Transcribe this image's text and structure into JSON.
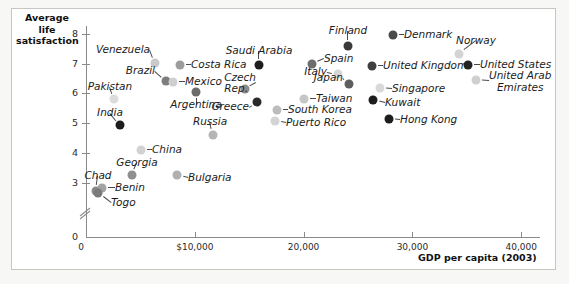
{
  "chart_data": {
    "type": "scatter",
    "title": "",
    "ylabel": "Average life satisfaction",
    "xlabel": "GDP per capita (2003)",
    "xlim": [
      0,
      44000
    ],
    "ylim": [
      2.6,
      8.4
    ],
    "y_ticks": [
      "0",
      "3",
      "4",
      "5",
      "6",
      "7",
      "8"
    ],
    "x_ticks": [
      "0",
      "$10,000",
      "20,000",
      "30,000",
      "40,000"
    ],
    "x_tick_values": [
      0,
      10000,
      20000,
      30000,
      40000
    ],
    "y_axis_break": true,
    "grid": false,
    "legend": "none",
    "points": [
      {
        "name": "Venezuela",
        "x": 6400,
        "y": 7.05,
        "shade": "#c9c9c9",
        "label_pos": "r",
        "lx": 150,
        "ly": 50,
        "dx": 155,
        "dy": 63
      },
      {
        "name": "Brazil",
        "x": 7450,
        "y": 6.65,
        "shade": "#7d7d7d",
        "label_pos": "r",
        "lx": 155,
        "ly": 71,
        "dx": 166,
        "dy": 81
      },
      {
        "name": "Costa Rica",
        "x": 9300,
        "y": 7.0,
        "shade": "#9c9c9c",
        "label_pos": "l",
        "lx": 191,
        "ly": 65,
        "dx": 180,
        "dy": 65
      },
      {
        "name": "Mexico",
        "x": 8050,
        "y": 6.6,
        "shade": "#cfcfcf",
        "label_pos": "l",
        "lx": 185,
        "ly": 82,
        "dx": 173,
        "dy": 82
      },
      {
        "name": "Argentina",
        "x": 10200,
        "y": 6.3,
        "shade": "#6b6b6b",
        "label_pos": "c",
        "lx": 196,
        "ly": 105,
        "dx": 196,
        "dy": 92
      },
      {
        "name": "Pakistan",
        "x": 2600,
        "y": 6.0,
        "shade": "#dcdcdc",
        "label_pos": "c",
        "lx": 110,
        "ly": 87,
        "dx": 114,
        "dy": 99
      },
      {
        "name": "India",
        "x": 3150,
        "y": 5.3,
        "shade": "#1d1d1d",
        "label_pos": "c",
        "lx": 110,
        "ly": 113,
        "dx": 120,
        "dy": 125
      },
      {
        "name": "Saudi Arabia",
        "x": 16000,
        "y": 7.0,
        "shade": "#1d1d1d",
        "label_pos": "c",
        "lx": 259,
        "ly": 51,
        "dx": 259,
        "dy": 65
      },
      {
        "name": "Czech Rep.",
        "x": 14700,
        "y": 6.2,
        "shade": "#8b8b8b",
        "label_pos": "l",
        "lx": 256,
        "ly": 83,
        "dx": 245,
        "dy": 89
      },
      {
        "name": "Greece",
        "x": 15800,
        "y": 5.95,
        "shade": "#2a2a2a",
        "label_pos": "r",
        "lx": 249,
        "ly": 107,
        "dx": 257,
        "dy": 102
      },
      {
        "name": "Russia",
        "x": 11700,
        "y": 4.9,
        "shade": "#b5b5b5",
        "label_pos": "c",
        "lx": 210,
        "ly": 122,
        "dx": 213,
        "dy": 135
      },
      {
        "name": "China",
        "x": 5100,
        "y": 4.55,
        "shade": "#d2d2d2",
        "label_pos": "l",
        "lx": 152,
        "ly": 150,
        "dx": 141,
        "dy": 150
      },
      {
        "name": "Georgia",
        "x": 4300,
        "y": 3.75,
        "shade": "#8f8f8f",
        "label_pos": "c",
        "lx": 137,
        "ly": 163,
        "dx": 132,
        "dy": 175
      },
      {
        "name": "Bulgaria",
        "x": 8450,
        "y": 3.78,
        "shade": "#b0b0b0",
        "label_pos": "l",
        "lx": 188,
        "ly": 178,
        "dx": 177,
        "dy": 175
      },
      {
        "name": "Chad",
        "x": 900,
        "y": 3.25,
        "shade": "#8a8a8a",
        "label_pos": "c",
        "lx": 98,
        "ly": 176,
        "dx": 96,
        "dy": 191
      },
      {
        "name": "Benin",
        "x": 1450,
        "y": 3.35,
        "shade": "#a3a3a3",
        "label_pos": "l",
        "lx": 115,
        "ly": 188,
        "dx": 102,
        "dy": 188
      },
      {
        "name": "Togo",
        "x": 1100,
        "y": 3.15,
        "shade": "#7a7a7a",
        "label_pos": "l",
        "lx": 111,
        "ly": 203,
        "dx": 98,
        "dy": 193
      },
      {
        "name": "Taiwan",
        "x": 20100,
        "y": 5.8,
        "shade": "#c6c6c6",
        "label_pos": "l",
        "lx": 316,
        "ly": 99,
        "dx": 304,
        "dy": 99
      },
      {
        "name": "South Korea",
        "x": 17800,
        "y": 5.45,
        "shade": "#bcbcbc",
        "label_pos": "l",
        "lx": 288,
        "ly": 110,
        "dx": 277,
        "dy": 110
      },
      {
        "name": "Puerto Rico",
        "x": 17600,
        "y": 5.1,
        "shade": "#d4d4d4",
        "label_pos": "l",
        "lx": 286,
        "ly": 123,
        "dx": 275,
        "dy": 121
      },
      {
        "name": "Spain",
        "x": 21000,
        "y": 7.15,
        "shade": "#6e6e6e",
        "label_pos": "l",
        "lx": 324,
        "ly": 59,
        "dx": 312,
        "dy": 64
      },
      {
        "name": "Italy",
        "x": 23400,
        "y": 6.8,
        "shade": "#d6d6d6",
        "label_pos": "r",
        "lx": 327,
        "ly": 72,
        "dx": 338,
        "dy": 74
      },
      {
        "name": "Japan",
        "x": 24400,
        "y": 6.45,
        "shade": "#5e5e5e",
        "label_pos": "r",
        "lx": 343,
        "ly": 78,
        "dx": 349,
        "dy": 84
      },
      {
        "name": "Finland",
        "x": 24300,
        "y": 7.75,
        "shade": "#3a3a3a",
        "label_pos": "c",
        "lx": 348,
        "ly": 31,
        "dx": 348,
        "dy": 46
      },
      {
        "name": "Denmark",
        "x": 28500,
        "y": 8.1,
        "shade": "#4a4a4a",
        "label_pos": "l",
        "lx": 404,
        "ly": 35,
        "dx": 393,
        "dy": 35
      },
      {
        "name": "United Kingdom",
        "x": 26500,
        "y": 7.1,
        "shade": "#3f3f3f",
        "label_pos": "l",
        "lx": 383,
        "ly": 66,
        "dx": 372,
        "dy": 66
      },
      {
        "name": "Singapore",
        "x": 27200,
        "y": 6.3,
        "shade": "#d9d9d9",
        "label_pos": "l",
        "lx": 392,
        "ly": 89,
        "dx": 380,
        "dy": 88
      },
      {
        "name": "Kuwait",
        "x": 26600,
        "y": 5.95,
        "shade": "#1d1d1d",
        "label_pos": "l",
        "lx": 385,
        "ly": 103,
        "dx": 373,
        "dy": 100
      },
      {
        "name": "Hong Kong",
        "x": 28000,
        "y": 5.55,
        "shade": "#1d1d1d",
        "label_pos": "l",
        "lx": 400,
        "ly": 120,
        "dx": 389,
        "dy": 119
      },
      {
        "name": "Norway",
        "x": 34300,
        "y": 7.45,
        "shade": "#d4d4d4",
        "label_pos": "c",
        "lx": 476,
        "ly": 41,
        "dx": 459,
        "dy": 54
      },
      {
        "name": "United States",
        "x": 35100,
        "y": 7.05,
        "shade": "#232323",
        "label_pos": "l",
        "lx": 480,
        "ly": 65,
        "dx": 468,
        "dy": 65
      },
      {
        "name": "United Arab Emirates",
        "x": 35900,
        "y": 6.55,
        "shade": "#cfcfcf",
        "label_pos": "l",
        "lx": 489,
        "ly": 81,
        "dx": 476,
        "dy": 80
      }
    ]
  },
  "axes": {
    "y_title_line1": "Average",
    "y_title_line2": "life",
    "y_title_line3": "satisfaction",
    "x_title": "GDP per capita (2003)"
  },
  "colors": {
    "axis": "#8a8a88",
    "frame": "#c8c6c2",
    "background": "#f7f7f6",
    "panel": "#ffffff",
    "text": "#1b1b1b"
  }
}
